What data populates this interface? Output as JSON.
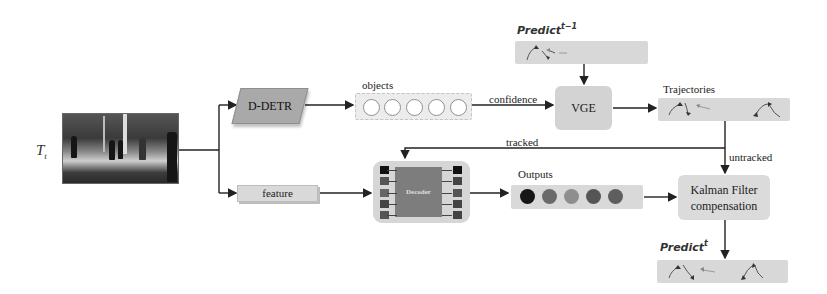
{
  "diagram": {
    "input": {
      "label_base": "T",
      "label_sub": "t",
      "image": "street-scene-pedestrians"
    },
    "detector": {
      "label": "D-DETR"
    },
    "objects": {
      "label": "objects",
      "count": 5
    },
    "edge_confidence": {
      "label": "confidence"
    },
    "vge": {
      "label": "VGE"
    },
    "predict_prev": {
      "label_base": "Predict",
      "label_sup": "t−1"
    },
    "trajectories": {
      "label": "Trajectories"
    },
    "edge_tracked": {
      "label": "tracked"
    },
    "edge_untracked": {
      "label": "untracked"
    },
    "feature": {
      "label": "feature"
    },
    "decoder": {
      "label": "Decoder"
    },
    "outputs": {
      "label": "Outputs",
      "colors": [
        "#161616",
        "#6a6a6a",
        "#8e8e8e",
        "#555555",
        "#5e5e5e"
      ]
    },
    "kalman": {
      "line1": "Kalman Filter",
      "line2": "compensation"
    },
    "predict_curr": {
      "label_base": "Predict",
      "label_sup": "t"
    }
  }
}
